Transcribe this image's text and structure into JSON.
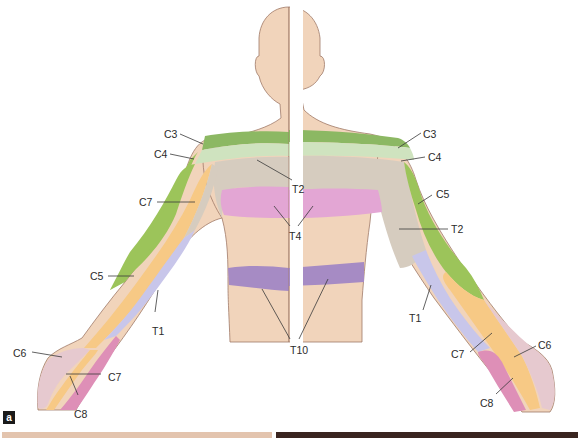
{
  "figure": {
    "panel_label": "a",
    "views": [
      "anterior (left half)",
      "posterior (right half)"
    ]
  },
  "colors": {
    "skin": "#f1d4bb",
    "skin_outline": "#a07a68",
    "C3": "#8cb863",
    "C4": "#cfe3bf",
    "C5": "#9cc45a",
    "C6": "#e6c9cf",
    "C7": "#f7c985",
    "C8": "#de8fb7",
    "T1": "#c8c6ea",
    "T2": "#d6ccbf",
    "T4": "#e3a6d4",
    "T10": "#a68bc4",
    "divider": "#ffffff",
    "label_text": "#2b2b2b"
  },
  "labels": {
    "left": {
      "C3": "C3",
      "C4": "C4",
      "C7_upper": "C7",
      "C5": "C5",
      "T1": "T1",
      "C6": "C6",
      "C7_hand": "C7",
      "C8": "C8"
    },
    "center": {
      "T2": "T2",
      "T4": "T4",
      "T10": "T10"
    },
    "right": {
      "C3": "C3",
      "C4": "C4",
      "C5": "C5",
      "T2": "T2",
      "T1": "T1",
      "C7": "C7",
      "C6": "C6",
      "C8": "C8"
    }
  }
}
